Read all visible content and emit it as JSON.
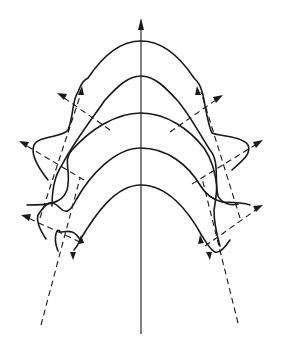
{
  "diagram": {
    "type": "wavefront-propagation",
    "colors": {
      "stroke": "#1a1a1a",
      "background": "#ffffff"
    },
    "axis": {
      "label": "",
      "direction": "up"
    },
    "wavefront_count": 5,
    "ray_count": 10,
    "labels": []
  }
}
